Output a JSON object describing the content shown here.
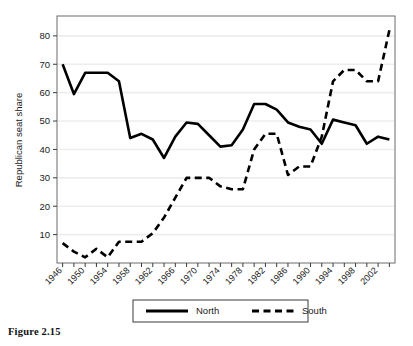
{
  "figure": {
    "caption": "Figure 2.15"
  },
  "chart_data": {
    "type": "line",
    "title": "",
    "xlabel": "",
    "ylabel": "Republican seat share",
    "xlim": [
      1945,
      2005
    ],
    "ylim": [
      0,
      87
    ],
    "grid": "horizontal",
    "legend_position": "bottom",
    "yticks": [
      10,
      20,
      30,
      40,
      50,
      60,
      70,
      80
    ],
    "xticks": [
      1946,
      1948,
      1950,
      1952,
      1954,
      1956,
      1958,
      1960,
      1962,
      1964,
      1966,
      1968,
      1970,
      1972,
      1974,
      1976,
      1978,
      1980,
      1982,
      1984,
      1986,
      1988,
      1990,
      1992,
      1994,
      1996,
      1998,
      2000,
      2002,
      2004
    ],
    "xtick_labels": [
      "1946",
      "1950",
      "1954",
      "1958",
      "1962",
      "1966",
      "1970",
      "1974",
      "1978",
      "1982",
      "1986",
      "1990",
      "1994",
      "1998",
      "2002"
    ],
    "x": [
      1946,
      1948,
      1950,
      1952,
      1954,
      1956,
      1958,
      1960,
      1962,
      1964,
      1966,
      1968,
      1970,
      1972,
      1974,
      1976,
      1978,
      1980,
      1982,
      1984,
      1986,
      1988,
      1990,
      1992,
      1994,
      1996,
      1998,
      2000,
      2002,
      2004
    ],
    "series": [
      {
        "name": "North",
        "style": "solid",
        "color": "#000000",
        "values": [
          70.0,
          59.5,
          67.0,
          67.0,
          67.0,
          64.0,
          44.0,
          45.5,
          43.5,
          37.0,
          44.5,
          49.5,
          49.0,
          45.0,
          41.0,
          41.5,
          47.0,
          56.0,
          56.0,
          54.0,
          49.5,
          48.0,
          47.0,
          42.0,
          50.5,
          49.5,
          48.5,
          42.0,
          44.5,
          43.5
        ]
      },
      {
        "name": "South",
        "style": "dashed",
        "color": "#000000",
        "values": [
          7.0,
          4.0,
          2.0,
          5.0,
          2.0,
          7.5,
          7.5,
          7.5,
          10.5,
          16.0,
          23.0,
          30.0,
          30.0,
          30.0,
          27.0,
          26.0,
          26.0,
          40.0,
          45.5,
          45.5,
          31.0,
          34.0,
          34.0,
          44.5,
          64.0,
          68.0,
          68.0,
          64.0,
          64.0,
          82.0
        ]
      }
    ],
    "legend": [
      {
        "label": "North",
        "style": "solid"
      },
      {
        "label": "South",
        "style": "dashed"
      }
    ]
  }
}
